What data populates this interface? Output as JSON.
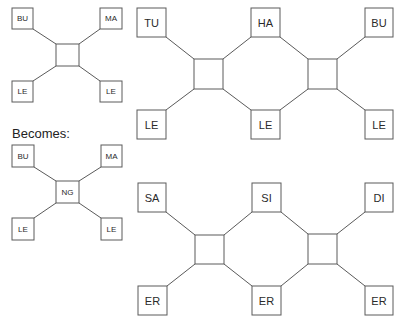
{
  "caption": "Becomes:",
  "colors": {
    "stroke": "#5a5a5a",
    "text": "#2a2a2a",
    "background": "#ffffff"
  },
  "diagrams": [
    {
      "id": "before",
      "center": {
        "label": "",
        "x": 56,
        "y": 44,
        "w": 23,
        "h": 22
      },
      "nodes": [
        {
          "label": "BU",
          "x": 12,
          "y": 8,
          "w": 21,
          "h": 21
        },
        {
          "label": "MA",
          "x": 100,
          "y": 8,
          "w": 22,
          "h": 21
        },
        {
          "label": "LE",
          "x": 12,
          "y": 81,
          "w": 21,
          "h": 21
        },
        {
          "label": "LE",
          "x": 100,
          "y": 81,
          "w": 22,
          "h": 21
        }
      ]
    },
    {
      "id": "after",
      "center": {
        "label": "NG",
        "x": 56,
        "y": 181,
        "w": 23,
        "h": 22
      },
      "nodes": [
        {
          "label": "BU",
          "x": 12,
          "y": 145,
          "w": 22,
          "h": 22
        },
        {
          "label": "MA",
          "x": 101,
          "y": 145,
          "w": 21,
          "h": 22
        },
        {
          "label": "LE",
          "x": 12,
          "y": 218,
          "w": 22,
          "h": 22
        },
        {
          "label": "LE",
          "x": 101,
          "y": 218,
          "w": 21,
          "h": 22
        }
      ]
    },
    {
      "id": "chain-top",
      "centers": [
        {
          "x": 194,
          "y": 59,
          "w": 29,
          "h": 30
        },
        {
          "x": 308,
          "y": 59,
          "w": 29,
          "h": 30
        }
      ],
      "nodes": [
        {
          "label": "TU",
          "x": 137,
          "y": 8,
          "w": 29,
          "h": 29
        },
        {
          "label": "HA",
          "x": 251,
          "y": 8,
          "w": 29,
          "h": 29
        },
        {
          "label": "BU",
          "x": 365,
          "y": 8,
          "w": 28,
          "h": 29
        },
        {
          "label": "LE",
          "x": 137,
          "y": 110,
          "w": 29,
          "h": 29
        },
        {
          "label": "LE",
          "x": 251,
          "y": 110,
          "w": 29,
          "h": 29
        },
        {
          "label": "LE",
          "x": 365,
          "y": 110,
          "w": 28,
          "h": 29
        }
      ]
    },
    {
      "id": "chain-bottom",
      "centers": [
        {
          "x": 195,
          "y": 235,
          "w": 29,
          "h": 29
        },
        {
          "x": 308,
          "y": 234,
          "w": 29,
          "h": 30
        }
      ],
      "nodes": [
        {
          "label": "SA",
          "x": 138,
          "y": 183,
          "w": 28,
          "h": 29
        },
        {
          "label": "SI",
          "x": 252,
          "y": 183,
          "w": 29,
          "h": 29
        },
        {
          "label": "DI",
          "x": 365,
          "y": 183,
          "w": 28,
          "h": 29
        },
        {
          "label": "ER",
          "x": 138,
          "y": 286,
          "w": 29,
          "h": 29
        },
        {
          "label": "ER",
          "x": 252,
          "y": 286,
          "w": 29,
          "h": 29
        },
        {
          "label": "ER",
          "x": 365,
          "y": 286,
          "w": 28,
          "h": 29
        }
      ]
    }
  ]
}
